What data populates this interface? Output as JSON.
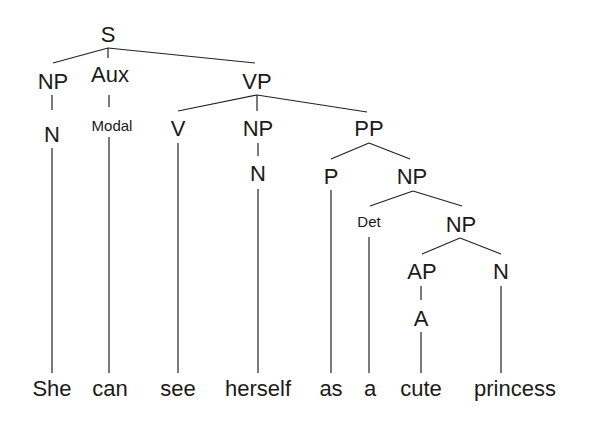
{
  "diagram": {
    "type": "syntax-tree",
    "sentence": "She can see herself as a cute princess",
    "nodes": {
      "s": "S",
      "np_subj": "NP",
      "aux": "Aux",
      "vp": "VP",
      "n_subj": "N",
      "modal": "Modal",
      "v": "V",
      "np_obj": "NP",
      "pp": "PP",
      "n_obj": "N",
      "p": "P",
      "np_pp": "NP",
      "det": "Det",
      "np_inner": "NP",
      "ap": "AP",
      "n_inner": "N",
      "a": "A"
    },
    "words": [
      "She",
      "can",
      "see",
      "herself",
      "as",
      "a",
      "cute",
      "princess"
    ],
    "line_color": "#222222",
    "text_color": "#1a1a1a"
  }
}
